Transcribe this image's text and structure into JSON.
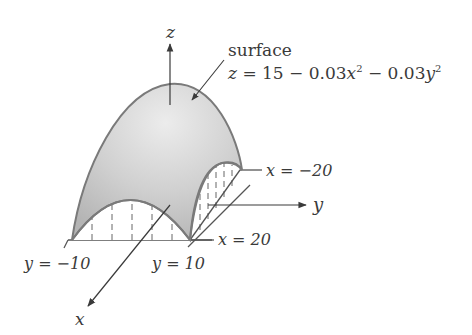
{
  "diagram": {
    "title": "surface",
    "equation": {
      "lhs": "z",
      "rhs_parts": [
        "15 − 0.03",
        "x",
        "2",
        " − 0.03",
        "y",
        "2"
      ],
      "full": "z = 15 − 0.03x² − 0.03y²"
    },
    "axes": {
      "z_label": "z",
      "y_label": "y",
      "x_label": "x"
    },
    "boundary_labels": {
      "x_neg": "x = −20",
      "x_pos": "x = 20",
      "y_neg": "y = −10",
      "y_pos": "y = 10"
    },
    "colors": {
      "surface_fill": "#c4c4c4",
      "surface_highlight": "#e6e6e6",
      "surface_edge": "#7a7a7a",
      "axis": "#3a3a3a",
      "text": "#3a3a3a"
    }
  }
}
